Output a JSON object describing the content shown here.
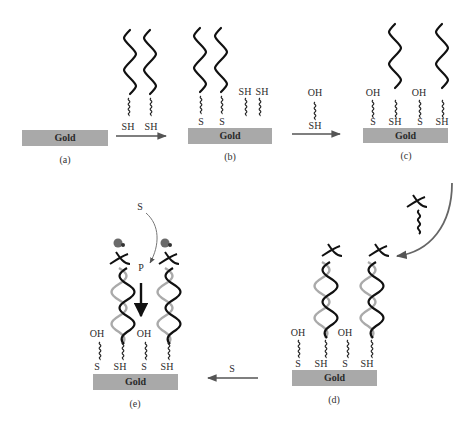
{
  "figure": {
    "substrate_label": "Gold",
    "colors": {
      "gold": "#a9a9a9",
      "strand": "#111111",
      "strand_light": "#aaaaaa",
      "arrow": "#555555",
      "probe": "#666666"
    }
  },
  "panels": [
    {
      "id": "a",
      "caption": "(a)",
      "gold": "Gold"
    },
    {
      "id": "b",
      "caption": "(b)",
      "gold": "Gold",
      "bound_labels": [
        "S",
        "S"
      ],
      "free_labels": [
        "SH",
        "SH"
      ]
    },
    {
      "id": "c",
      "caption": "(c)",
      "gold": "Gold",
      "top_labels": [
        "OH",
        "OH"
      ],
      "bottom_labels": [
        "S",
        "SH",
        "S",
        "SH"
      ]
    },
    {
      "id": "d",
      "caption": "(d)",
      "gold": "Gold",
      "top_labels": [
        "OH",
        "OH"
      ],
      "bottom_labels": [
        "S",
        "SH",
        "S",
        "SH"
      ]
    },
    {
      "id": "e",
      "caption": "(e)",
      "gold": "Gold",
      "top_labels": [
        "OH",
        "OH"
      ],
      "bottom_labels": [
        "S",
        "SH",
        "S",
        "SH"
      ]
    }
  ],
  "arrows": [
    {
      "from": "a",
      "to": "b",
      "labels": [
        "SH",
        "SH"
      ]
    },
    {
      "from": "b",
      "to": "c",
      "top_label": "OH",
      "bottom_label": "SH"
    },
    {
      "from": "c",
      "to": "d",
      "reagent": "target strand"
    },
    {
      "from": "d",
      "to": "e",
      "label": "S"
    }
  ],
  "enzyme_step": {
    "substrate": "S",
    "product": "P"
  }
}
